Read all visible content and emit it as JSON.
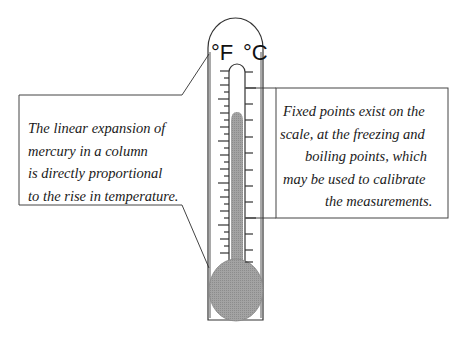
{
  "diagram": {
    "type": "thermometer-explainer",
    "scale_labels": {
      "left": "°F",
      "right": "°C"
    },
    "left_callout": {
      "lines": [
        "The linear expansion of",
        "mercury in a column",
        "is directly proportional",
        "to the rise in temperature."
      ]
    },
    "right_callout": {
      "lines": [
        "Fixed points exist on the",
        "scale, at  the freezing and",
        "boiling points, which",
        "may  be used to calibrate",
        "the measurements."
      ]
    },
    "colors": {
      "outline": "#333333",
      "mercury": "#9a9a9a",
      "background": "#ffffff"
    }
  }
}
